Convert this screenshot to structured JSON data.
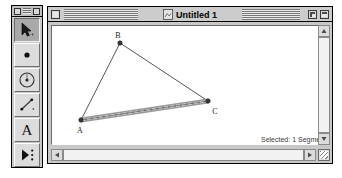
{
  "palette": {
    "name": "Tool Palette",
    "close_box": "close-box",
    "tools": [
      {
        "id": "arrow",
        "label": "Selection Arrow Tool",
        "icon": "arrow-cursor-icon",
        "active": true
      },
      {
        "id": "point",
        "label": "Point Tool",
        "icon": "point-dot-icon",
        "active": false
      },
      {
        "id": "compass",
        "label": "Compass Circle Tool",
        "icon": "circle-compass-icon",
        "active": false
      },
      {
        "id": "straightedge",
        "label": "Straightedge Segment Tool",
        "icon": "line-segment-icon",
        "active": false
      },
      {
        "id": "text",
        "label": "Text Tool",
        "icon": "text-a-icon",
        "glyph": "A",
        "active": false
      },
      {
        "id": "custom",
        "label": "Custom Tool",
        "icon": "play-dots-icon",
        "active": false
      }
    ]
  },
  "window": {
    "title": "Untitled 1",
    "doc_icon": "document-icon",
    "close_button": "close-button",
    "zoom_button": "zoom-button",
    "collapse_button": "collapse-button",
    "status": "Selected: 1 Segment"
  },
  "sketch": {
    "points": [
      {
        "name": "A",
        "x": 29,
        "y": 94,
        "label_dx": -1,
        "label_dy": 13
      },
      {
        "name": "B",
        "x": 68,
        "y": 17,
        "label_dx": -2,
        "label_dy": -5
      },
      {
        "name": "C",
        "x": 156,
        "y": 75,
        "label_dx": 7,
        "label_dy": 13
      }
    ],
    "segments": [
      {
        "name": "AB",
        "from": "A",
        "to": "B",
        "selected": false
      },
      {
        "name": "BC",
        "from": "B",
        "to": "C",
        "selected": false
      },
      {
        "name": "AC",
        "from": "A",
        "to": "C",
        "selected": true
      }
    ]
  },
  "scrollbars": {
    "vertical_up": "scroll-up-arrow",
    "vertical_down": "scroll-down-arrow",
    "horizontal_left": "scroll-left-arrow",
    "horizontal_right": "scroll-right-arrow",
    "grow_box": "resize-grip"
  },
  "colors": {
    "window_chrome": "#c8c8c8",
    "canvas": "#ffffff",
    "geometry_stroke": "#555555",
    "selection_highlight": "#9a9a9a"
  }
}
